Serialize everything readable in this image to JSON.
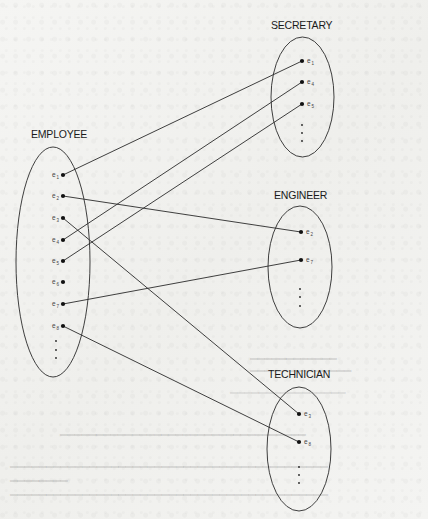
{
  "figure": {
    "type": "set-instance diagram (superclass/subclass specialization)",
    "superclass": {
      "name": "EMPLOYEE",
      "entities": [
        "e1",
        "e2",
        "e3",
        "e4",
        "e5",
        "e6",
        "e7",
        "e8"
      ],
      "has_more": true
    },
    "subclasses": [
      {
        "name": "SECRETARY",
        "entities": [
          "e1",
          "e4",
          "e5"
        ],
        "has_more": true
      },
      {
        "name": "ENGINEER",
        "entities": [
          "e2",
          "e7"
        ],
        "has_more": true
      },
      {
        "name": "TECHNICIAN",
        "entities": [
          "e3",
          "e8"
        ],
        "has_more": true
      }
    ],
    "links": [
      {
        "from": "EMPLOYEE.e1",
        "to": "SECRETARY.e1"
      },
      {
        "from": "EMPLOYEE.e4",
        "to": "SECRETARY.e4"
      },
      {
        "from": "EMPLOYEE.e5",
        "to": "SECRETARY.e5"
      },
      {
        "from": "EMPLOYEE.e2",
        "to": "ENGINEER.e2"
      },
      {
        "from": "EMPLOYEE.e7",
        "to": "ENGINEER.e7"
      },
      {
        "from": "EMPLOYEE.e3",
        "to": "TECHNICIAN.e3"
      },
      {
        "from": "EMPLOYEE.e8",
        "to": "TECHNICIAN.e8"
      }
    ]
  },
  "labels": {
    "employee": "EMPLOYEE",
    "secretary": "SECRETARY",
    "engineer": "ENGINEER",
    "technician": "TECHNICIAN"
  },
  "employee_items": [
    {
      "base": "e",
      "sub": "1"
    },
    {
      "base": "e",
      "sub": "2"
    },
    {
      "base": "e",
      "sub": "3"
    },
    {
      "base": "e",
      "sub": "4"
    },
    {
      "base": "e",
      "sub": "5"
    },
    {
      "base": "e",
      "sub": "6"
    },
    {
      "base": "e",
      "sub": "7"
    },
    {
      "base": "e",
      "sub": "8"
    }
  ],
  "secretary_items": [
    {
      "base": "e",
      "sub": "1"
    },
    {
      "base": "e",
      "sub": "4"
    },
    {
      "base": "e",
      "sub": "5"
    }
  ],
  "engineer_items": [
    {
      "base": "e",
      "sub": "2"
    },
    {
      "base": "e",
      "sub": "7"
    }
  ],
  "technician_items": [
    {
      "base": "e",
      "sub": "3"
    },
    {
      "base": "e",
      "sub": "8"
    }
  ],
  "colors": {
    "ink": "#1a1a1a",
    "line": "#2a2a2a",
    "paper": "#f3f3f1"
  }
}
